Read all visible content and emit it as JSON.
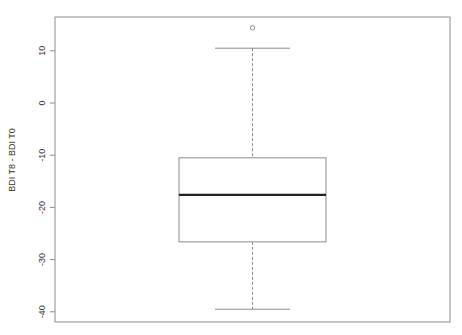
{
  "chart_data": {
    "type": "boxplot",
    "title": "",
    "xlabel": "",
    "ylabel": "BDI T8 - BDI T0",
    "ylim": [
      -41.5,
      16.5
    ],
    "yticks": [
      10,
      0,
      -10,
      -20,
      -30,
      -40
    ],
    "ytick_labels": [
      "10",
      "0",
      "-10",
      "-20",
      "-30",
      "-40"
    ],
    "grid": false,
    "legend": null,
    "series": [
      {
        "name": "BDI T8 - BDI T0",
        "whisker_high": 10.5,
        "q3": -10.5,
        "median": -17.6,
        "q1": -26.6,
        "whisker_low": -39.5,
        "outliers": [
          14.4
        ]
      }
    ]
  },
  "colors": {
    "frame": "#8c8c8c",
    "box": "#8c8c8c",
    "median": "#222222",
    "whisker": "#8c8c8c",
    "text": "#333333"
  }
}
